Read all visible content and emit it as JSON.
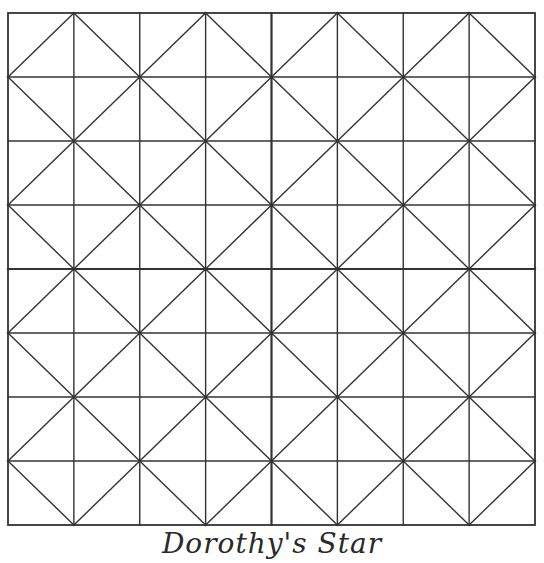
{
  "caption": "Dorothy's Star",
  "grid": {
    "columns": 8,
    "rows": 8,
    "x0": 8,
    "y0": 13,
    "x1": 535,
    "y1": 525,
    "line_color": "#333333",
    "line_width": 1.4,
    "center_line_width": 2.2,
    "background": "#ffffff"
  },
  "pattern": {
    "description": "Each cell has one diagonal; diagonals join grid points where (col+row) is odd, forming a diamond lattice",
    "diagonal_rule": "cell (c,r): if (c+r) even draw from (c+1,r) to (c,r+1); else from (c,r) to (c+1,r+1)"
  }
}
